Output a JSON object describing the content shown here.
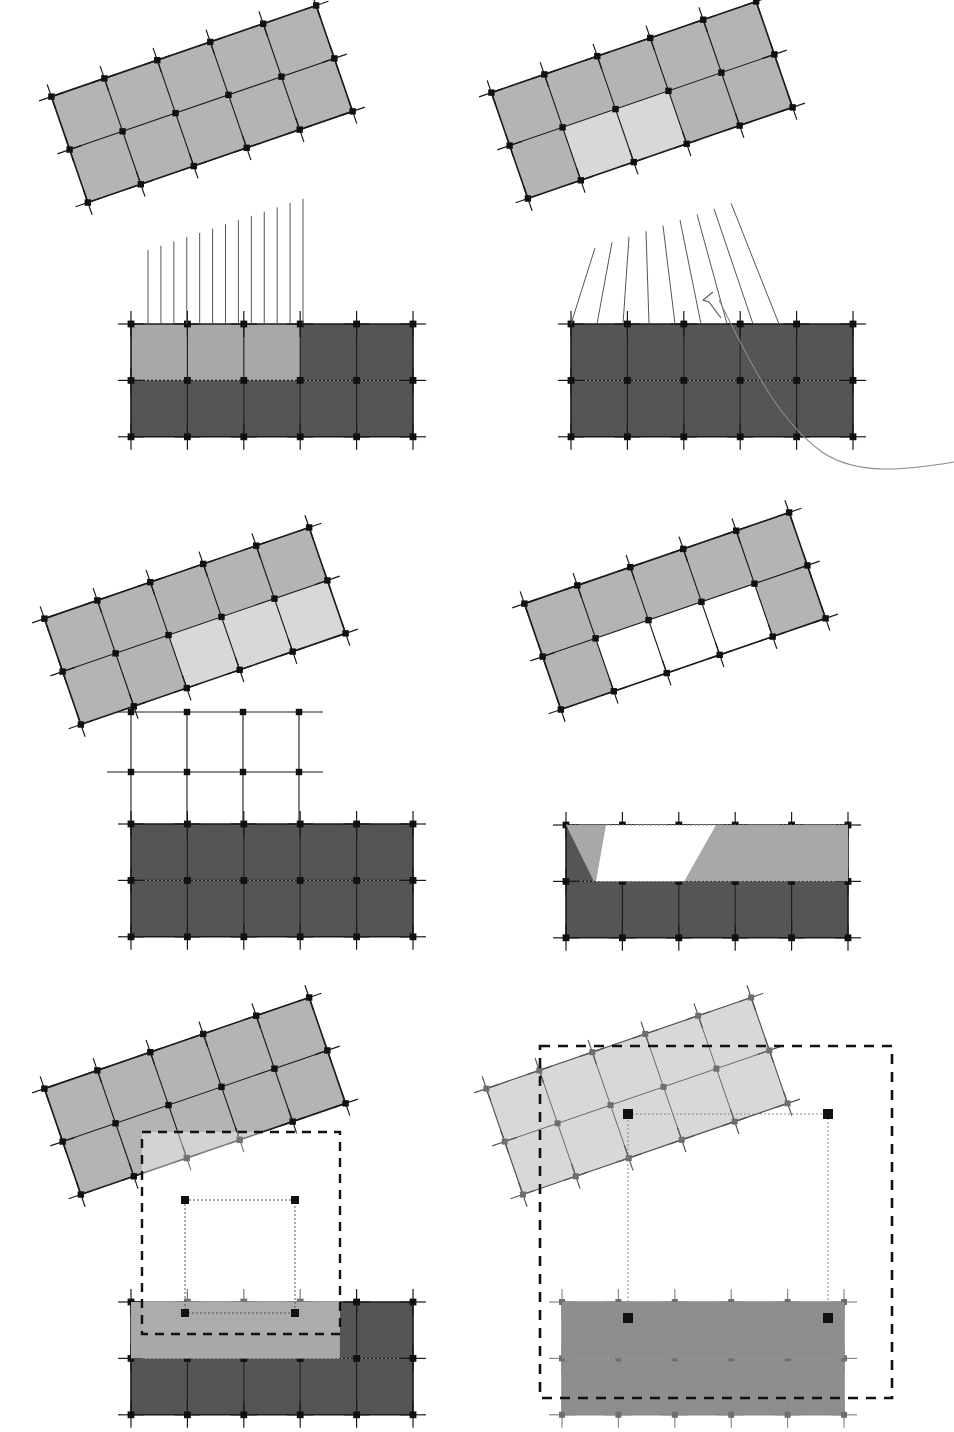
{
  "figure": {
    "panel_count": 6,
    "layout": {
      "columns": 2,
      "rows": 3,
      "width": 954,
      "height": 1427
    }
  },
  "colors": {
    "background": "#ffffff",
    "stroke_dark": "#1a1a1a",
    "stroke_mid": "#555555",
    "stroke_light": "#8a8a8a",
    "fill_source_grid": "#b4b4b4",
    "fill_highlight": "#d8d8d8",
    "fill_target_dark": "#555555",
    "fill_target_light": "#a8a8a8",
    "fill_faded_source": "#c9c9c9",
    "fill_faded_target": "#8e8e8e",
    "node_black": "#111111",
    "node_gray": "#6e6e6e",
    "dashed_box": "#111111"
  },
  "geometry": {
    "source_grid": {
      "cols": 5,
      "rows": 2,
      "cell": 56,
      "rotation_deg": -19
    },
    "target_grid": {
      "cols": 5,
      "rows": 2,
      "cell": 56.4
    },
    "tick_length": 13
  },
  "panels": [
    {
      "id": "panel-1",
      "name": "vertical-projection",
      "origin": {
        "x": 0,
        "y": 0
      },
      "source": {
        "x": 62,
        "y": 48,
        "rot": -19,
        "highlight_cells": []
      },
      "target": {
        "x": 131,
        "y": 324,
        "light_cells": [
          [
            0,
            0
          ],
          [
            1,
            0
          ],
          [
            2,
            0
          ]
        ]
      },
      "projection": {
        "type": "vertical-lines",
        "count": 13,
        "from_x": 148,
        "to_x": 303
      },
      "curve": false,
      "dashed_box": null
    },
    {
      "id": "panel-2",
      "name": "fanned-projection-with-curve",
      "origin": {
        "x": 477,
        "y": 0
      },
      "source": {
        "x": 25,
        "y": 44,
        "rot": -19,
        "highlight_cells": [
          [
            1,
            1
          ],
          [
            2,
            1
          ]
        ]
      },
      "target": {
        "x": 94,
        "y": 324,
        "light_cells": []
      },
      "projection": {
        "type": "fan-lines",
        "count": 9
      },
      "curve": true,
      "dashed_box": null
    },
    {
      "id": "panel-3",
      "name": "subgrid-overlay",
      "origin": {
        "x": 0,
        "y": 480
      },
      "source": {
        "x": 55,
        "y": 90,
        "rot": -19,
        "highlight_cells": [
          [
            2,
            1
          ],
          [
            3,
            1
          ],
          [
            4,
            1
          ]
        ]
      },
      "target": {
        "x": 131,
        "y": 344,
        "light_cells": []
      },
      "projection": {
        "type": "axis-subgrid",
        "cols": 4,
        "rows": 2
      },
      "curve": false,
      "dashed_box": null
    },
    {
      "id": "panel-4",
      "name": "overlap-clip",
      "origin": {
        "x": 477,
        "y": 480
      },
      "source": {
        "x": 58,
        "y": 75,
        "rot": -19,
        "highlight_cells": []
      },
      "target": {
        "x": 89,
        "y": 345,
        "light_cells": []
      },
      "projection": {
        "type": "clipped-overlap"
      },
      "curve": false,
      "dashed_box": null
    },
    {
      "id": "panel-5",
      "name": "bounding-box-small",
      "origin": {
        "x": 0,
        "y": 980
      },
      "source": {
        "x": 55,
        "y": 60,
        "rot": -19,
        "highlight_cells": []
      },
      "target": {
        "x": 131,
        "y": 322,
        "light_cells": []
      },
      "projection": {
        "type": "bbox"
      },
      "curve": false,
      "dashed_box": {
        "x": 142,
        "y": 152,
        "w": 198,
        "h": 202,
        "corner_markers": 4
      }
    },
    {
      "id": "panel-6",
      "name": "bounding-box-large",
      "origin": {
        "x": 477,
        "y": 980
      },
      "source": {
        "x": 20,
        "y": 60,
        "rot": -19,
        "highlight_cells": []
      },
      "target": {
        "x": 85,
        "y": 322,
        "light_cells": []
      },
      "projection": {
        "type": "bbox"
      },
      "curve": false,
      "dashed_box": {
        "x": 63,
        "y": 66,
        "w": 352,
        "h": 352,
        "corner_markers": 4
      }
    }
  ]
}
